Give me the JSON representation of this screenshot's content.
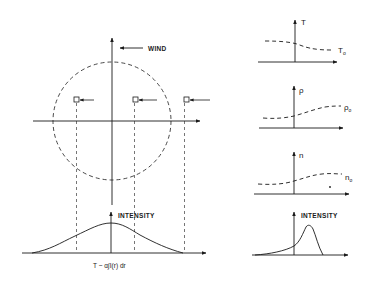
{
  "main_diagram": {
    "wind_label": "WIND",
    "intensity_label": "INTENSITY",
    "formula": "T ~ α∫I(r) dr",
    "icons": [
      "wind-arrow-icon",
      "square-probe-icon"
    ]
  },
  "panels": [
    {
      "axis_label": "T",
      "curve_label": "T",
      "curve_subscript": "o",
      "profile": "decreasing"
    },
    {
      "axis_label": "ρ",
      "curve_label": "ρ",
      "curve_subscript": "o",
      "profile": "increasing"
    },
    {
      "axis_label": "n",
      "curve_label": "n",
      "curve_subscript": "o",
      "profile": "increasing"
    },
    {
      "axis_label": "INTENSITY",
      "profile": "skewed-peak"
    }
  ],
  "colors": {
    "ink": "#1a1a1a",
    "background": "#ffffff"
  }
}
